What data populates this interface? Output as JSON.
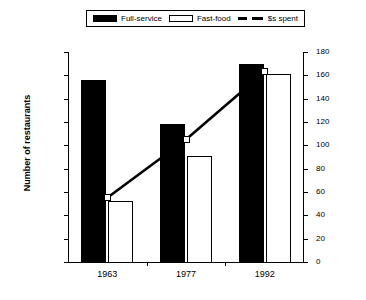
{
  "legend": {
    "entries": [
      {
        "label": "Full-service",
        "icon": "filled-square-swatch"
      },
      {
        "label": "Fast-food",
        "icon": "open-square-swatch"
      },
      {
        "label": "$s spent",
        "icon": "dashed-line-swatch"
      }
    ]
  },
  "axes": {
    "left": {
      "title": "Number of restaurants",
      "ticks": [
        "180,000",
        "160,000",
        "140,000",
        "120,000",
        "100,000",
        "80,000",
        "60,000",
        "40,000",
        "20,000",
        "0"
      ]
    },
    "right": {
      "title": "$s spent on eating out (In billions of 1992 $s)",
      "ticks": [
        "180",
        "160",
        "140",
        "120",
        "100",
        "80",
        "60",
        "40",
        "20",
        "0"
      ]
    },
    "x": {
      "ticks": [
        "1963",
        "1977",
        "1992"
      ]
    }
  },
  "chart_data": {
    "type": "bar",
    "title": "",
    "xlabel": "",
    "ylabel": "Number of restaurants",
    "y2label": "$s spent on eating out (In billions of 1992 $s)",
    "categories": [
      "1963",
      "1977",
      "1992"
    ],
    "ylim": [
      0,
      180000
    ],
    "y2lim": [
      0,
      180
    ],
    "ytick_step": 20000,
    "y2tick_step": 20,
    "grid": false,
    "legend_position": "top-center",
    "series": [
      {
        "name": "Full-service",
        "type": "bar",
        "axis": "left",
        "color": "#000000",
        "values": [
          156000,
          118000,
          170000
        ]
      },
      {
        "name": "Fast-food",
        "type": "bar",
        "axis": "left",
        "color": "#ffffff",
        "values": [
          52000,
          91000,
          161000
        ]
      },
      {
        "name": "$s spent",
        "type": "line",
        "axis": "right",
        "color": "#000000",
        "values": [
          55,
          105,
          163
        ]
      }
    ]
  }
}
